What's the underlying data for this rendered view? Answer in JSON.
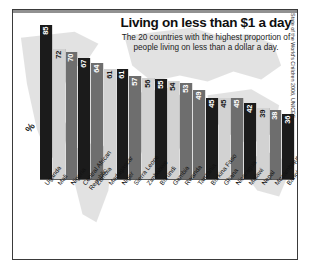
{
  "title": "Living on less than $1 a day",
  "subtitle": "The 20 countries with the highest proportion of people living on less than a dollar a day.",
  "y_axis_label": "%",
  "source": "State of the World's Children 2006, UNICEF",
  "colors": {
    "bar_dark": "#1b1b1b",
    "bar_light": "#d2d2d2",
    "bar_mid": "#6e6e6e",
    "frame": "#3a3a3a",
    "background": "#ffffff",
    "map": "#c4c4c4"
  },
  "chart_data": {
    "type": "bar",
    "title": "Living on less than $1 a day",
    "subtitle": "The 20 countries with the highest proportion of people living on less than a dollar a day.",
    "xlabel": "",
    "ylabel": "%",
    "ylim": [
      0,
      90
    ],
    "grid": false,
    "legend": null,
    "source": "State of the World's Children 2006, UNICEF",
    "categories": [
      "Uganda",
      "Mali",
      "Nigeria",
      "Central African Republic",
      "Zambia",
      "Madagascar",
      "Niger",
      "Sierra Leone",
      "Zimbabwe",
      "Burundi",
      "Gambia",
      "Rwanda",
      "Tanzania",
      "Burkina Faso",
      "Ghana",
      "Nicaragua",
      "Malawi",
      "Nepal",
      "Mozambique",
      "Bangladesh"
    ],
    "values": [
      85,
      72,
      70,
      67,
      64,
      61,
      61,
      57,
      56,
      55,
      54,
      53,
      49,
      45,
      45,
      45,
      42,
      39,
      38,
      36
    ],
    "bar_shades": [
      "dark",
      "light",
      "mid",
      "dark",
      "mid",
      "light",
      "dark",
      "mid",
      "light",
      "dark",
      "light",
      "mid",
      "mid",
      "dark",
      "light",
      "mid",
      "dark",
      "light",
      "mid",
      "dark"
    ]
  }
}
